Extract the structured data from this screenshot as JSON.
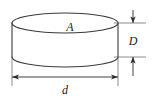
{
  "figure": {
    "type": "technical-drawing",
    "background_color": "#ffffff",
    "stroke_color": "#3a3a3a",
    "dimension_color": "#2b2b2b",
    "extension_color": "#6e6e6e",
    "labels": {
      "area": "A",
      "thickness": "D",
      "diameter": "d"
    },
    "geometry": {
      "top_ellipse_cx": 65,
      "top_ellipse_cy": 23,
      "top_ellipse_rx": 53,
      "top_ellipse_ry": 10,
      "body_height": 34,
      "bottom_ellipse_cy": 57
    },
    "dimensions": {
      "thickness": {
        "axis": "vertical",
        "x": 133,
        "y_top": 23,
        "y_bottom": 57,
        "arrow_direction": "inward",
        "label": "D"
      },
      "diameter": {
        "axis": "horizontal",
        "y": 77,
        "x_left": 12,
        "x_right": 118,
        "arrow_direction": "outward",
        "label": "d"
      }
    }
  }
}
